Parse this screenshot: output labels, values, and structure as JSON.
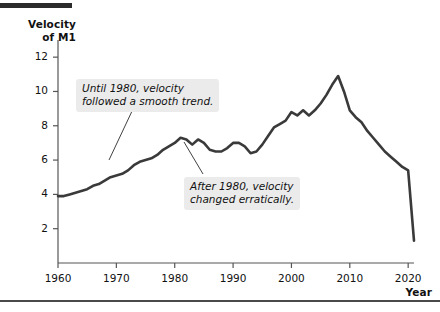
{
  "chart_data": {
    "type": "line",
    "title": "",
    "xlabel": "Year",
    "ylabel": "Velocity of M1",
    "xlim": [
      1960,
      2021
    ],
    "ylim": [
      0,
      13
    ],
    "grid": false,
    "legend": null,
    "x_ticks": [
      "1960",
      "1970",
      "1980",
      "1990",
      "2000",
      "2010",
      "2020"
    ],
    "y_ticks": [
      "2",
      "4",
      "6",
      "8",
      "10",
      "12"
    ],
    "series": [
      {
        "name": "Velocity of M1",
        "x": [
          1960,
          1961,
          1962,
          1963,
          1964,
          1965,
          1966,
          1967,
          1968,
          1969,
          1970,
          1971,
          1972,
          1973,
          1974,
          1975,
          1976,
          1977,
          1978,
          1979,
          1980,
          1981,
          1982,
          1983,
          1984,
          1985,
          1986,
          1987,
          1988,
          1989,
          1990,
          1991,
          1992,
          1993,
          1994,
          1995,
          1996,
          1997,
          1998,
          1999,
          2000,
          2001,
          2002,
          2003,
          2004,
          2005,
          2006,
          2007,
          2008,
          2009,
          2010,
          2011,
          2012,
          2013,
          2014,
          2015,
          2016,
          2017,
          2018,
          2019,
          2020,
          2021
        ],
        "values": [
          3.9,
          3.9,
          4.0,
          4.1,
          4.2,
          4.3,
          4.5,
          4.6,
          4.8,
          5.0,
          5.1,
          5.2,
          5.4,
          5.7,
          5.9,
          6.0,
          6.1,
          6.3,
          6.6,
          6.8,
          7.0,
          7.3,
          7.2,
          6.9,
          7.2,
          7.0,
          6.6,
          6.5,
          6.5,
          6.7,
          7.0,
          7.0,
          6.8,
          6.4,
          6.5,
          6.9,
          7.4,
          7.9,
          8.1,
          8.3,
          8.8,
          8.6,
          8.9,
          8.6,
          8.9,
          9.3,
          9.8,
          10.4,
          10.9,
          10.0,
          8.9,
          8.5,
          8.2,
          7.7,
          7.3,
          6.9,
          6.5,
          6.2,
          5.9,
          5.6,
          5.4,
          1.3
        ]
      }
    ],
    "annotations": [
      {
        "id": "smooth-trend",
        "text_line1": "Until 1980, velocity",
        "text_line2": "followed a smooth trend.",
        "points_to_year": 1972
      },
      {
        "id": "erratic",
        "text_line1": "After 1980, velocity",
        "text_line2": "changed erratically.",
        "points_to_year": 1983
      }
    ],
    "line_color": "#3a3a3a",
    "annotation_background": "#ebebeb",
    "axis_color": "#555555",
    "text_color": "#111111"
  }
}
